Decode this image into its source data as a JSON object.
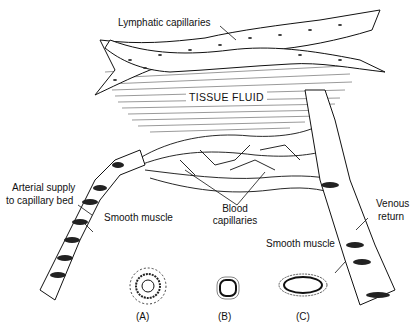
{
  "diagram": {
    "type": "anatomical illustration",
    "labels": {
      "lymphatic": "Lymphatic capillaries",
      "tissue_fluid": "TISSUE FLUID",
      "arterial_1": "Arterial supply",
      "arterial_2": "to capillary bed",
      "smooth_muscle_left": "Smooth muscle",
      "blood_1": "Blood",
      "blood_2": "capillaries",
      "venous_1": "Venous",
      "venous_2": "return",
      "smooth_muscle_right": "Smooth muscle"
    },
    "cross_sections": [
      {
        "label": "(A)"
      },
      {
        "label": "(B)"
      },
      {
        "label": "(C)"
      }
    ],
    "colors": {
      "ink": "#111111",
      "background": "#ffffff"
    }
  }
}
